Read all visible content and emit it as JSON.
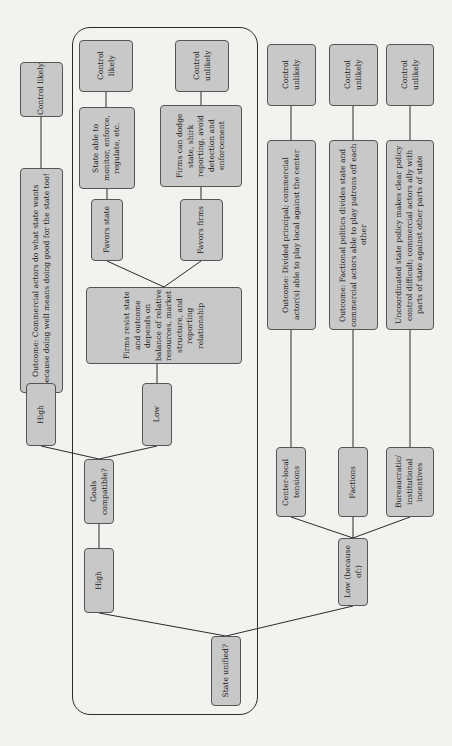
{
  "diagram": {
    "orientation": "rotated-90-ccw",
    "root": {
      "label": "State unified?"
    },
    "unified_branch": {
      "label": "High",
      "question": "Goals compatible?",
      "goals_high": {
        "label": "High",
        "outcome": "Outcome: Commercial actors do what state wants because doing well means doing good for the state too!",
        "result": "Control likely"
      },
      "goals_low": {
        "label": "Low",
        "description": "Firms resist state and outcome depends on balance of relative resources, market structure, and reporting relationship",
        "favors_state": {
          "label": "Favors state",
          "description": "State able to monitor, enforce, regulate, etc.",
          "result": "Control likely"
        },
        "favors_firms": {
          "label": "Favors firms",
          "description": "Firms can dodge state, shirk reporting, avoid detection and enforcement",
          "result": "Control unlikely"
        }
      }
    },
    "not_unified_branch": {
      "label": "Low (because of:)",
      "causes": [
        {
          "label": "Center-local tensions",
          "outcome": "Outcome: Divided principal; commercial actor(s) able to play local against the center",
          "result": "Control unlikely"
        },
        {
          "label": "Factions",
          "outcome": "Outcome: Factional politics divides state and commercial actors able to play patrons off each other",
          "result": "Control unlikely"
        },
        {
          "label": "Bureaucratic/ institutional incentives",
          "outcome": "Uncoordinated state policy makes clear policy control difficult; commercial actors ally with parts of state against other parts of state",
          "result": "Control unlikely"
        }
      ]
    }
  },
  "colors": {
    "box_fill": "#c8c8c8",
    "box_border": "#555555",
    "line": "#2a2a2a",
    "background": "#f4f2ef"
  }
}
